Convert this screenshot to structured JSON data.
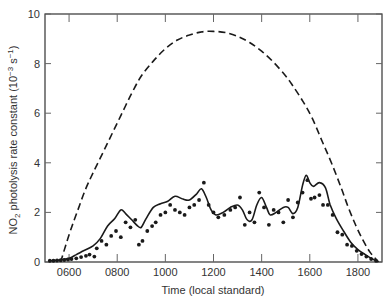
{
  "chart_data": {
    "type": "line",
    "title": "",
    "xlabel": "Time (local standard)",
    "ylabel": "NO2 photolysis rate constant (10^-3 s^-1)",
    "ylabel_parts": {
      "pre": "NO",
      "sub": "2",
      "mid": " photolysis rate constant (10",
      "sup1": "−3",
      "mid2": " s",
      "sup2": "−1",
      "post": ")"
    },
    "xlim": [
      500,
      1900
    ],
    "ylim": [
      0,
      10
    ],
    "x_ticks": [
      600,
      800,
      1000,
      1200,
      1400,
      1600,
      1800
    ],
    "x_tick_labels": [
      "0600",
      "0800",
      "1000",
      "1200",
      "1400",
      "1600",
      "1800"
    ],
    "y_ticks": [
      0,
      2,
      4,
      6,
      8,
      10
    ],
    "y_tick_labels": [
      "0",
      "2",
      "4",
      "6",
      "8",
      "10"
    ],
    "grid": false,
    "legend": null,
    "series": [
      {
        "name": "Clear-sky calculated (dashed)",
        "style": "dashed",
        "color": "#1a1a1a",
        "points": [
          [
            5.65,
            0.0
          ],
          [
            6.0,
            1.1
          ],
          [
            6.33,
            2.0
          ],
          [
            6.67,
            2.9
          ],
          [
            7.0,
            3.6
          ],
          [
            7.4,
            4.4
          ],
          [
            7.8,
            5.2
          ],
          [
            8.2,
            6.0
          ],
          [
            8.6,
            6.8
          ],
          [
            9.0,
            7.5
          ],
          [
            9.5,
            8.1
          ],
          [
            10.0,
            8.6
          ],
          [
            10.5,
            8.95
          ],
          [
            11.0,
            9.15
          ],
          [
            11.5,
            9.28
          ],
          [
            12.0,
            9.3
          ],
          [
            12.5,
            9.25
          ],
          [
            13.0,
            9.1
          ],
          [
            13.5,
            8.85
          ],
          [
            14.0,
            8.5
          ],
          [
            14.5,
            8.05
          ],
          [
            15.0,
            7.5
          ],
          [
            15.3,
            7.1
          ],
          [
            15.7,
            6.5
          ],
          [
            16.1,
            5.8
          ],
          [
            16.5,
            4.9
          ],
          [
            16.9,
            4.0
          ],
          [
            17.3,
            3.0
          ],
          [
            17.6,
            2.2
          ],
          [
            17.9,
            1.5
          ],
          [
            18.2,
            0.9
          ],
          [
            18.5,
            0.4
          ],
          [
            18.85,
            0.0
          ]
        ]
      },
      {
        "name": "Measured smoothed (solid)",
        "style": "solid",
        "color": "#1a1a1a",
        "points": [
          [
            5.2,
            0.05
          ],
          [
            5.6,
            0.08
          ],
          [
            6.0,
            0.15
          ],
          [
            6.3,
            0.3
          ],
          [
            6.6,
            0.45
          ],
          [
            7.0,
            0.65
          ],
          [
            7.3,
            0.95
          ],
          [
            7.6,
            1.45
          ],
          [
            7.9,
            1.75
          ],
          [
            8.15,
            2.1
          ],
          [
            8.35,
            1.95
          ],
          [
            8.6,
            1.7
          ],
          [
            8.85,
            1.45
          ],
          [
            9.0,
            1.4
          ],
          [
            9.2,
            1.75
          ],
          [
            9.5,
            2.2
          ],
          [
            9.8,
            2.35
          ],
          [
            10.1,
            2.45
          ],
          [
            10.4,
            2.65
          ],
          [
            10.7,
            2.55
          ],
          [
            11.0,
            2.5
          ],
          [
            11.3,
            2.75
          ],
          [
            11.5,
            2.95
          ],
          [
            11.7,
            2.6
          ],
          [
            11.9,
            2.1
          ],
          [
            12.1,
            1.9
          ],
          [
            12.4,
            2.0
          ],
          [
            12.7,
            2.2
          ],
          [
            13.0,
            2.3
          ],
          [
            13.2,
            2.1
          ],
          [
            13.4,
            1.7
          ],
          [
            13.6,
            1.7
          ],
          [
            13.8,
            2.3
          ],
          [
            14.0,
            2.6
          ],
          [
            14.2,
            2.2
          ],
          [
            14.35,
            1.9
          ],
          [
            14.6,
            2.0
          ],
          [
            14.9,
            2.2
          ],
          [
            15.1,
            2.2
          ],
          [
            15.3,
            1.95
          ],
          [
            15.5,
            2.2
          ],
          [
            15.7,
            3.1
          ],
          [
            15.85,
            3.5
          ],
          [
            16.0,
            3.2
          ],
          [
            16.15,
            3.05
          ],
          [
            16.4,
            3.2
          ],
          [
            16.65,
            3.0
          ],
          [
            16.85,
            2.3
          ],
          [
            17.1,
            1.75
          ],
          [
            17.4,
            1.25
          ],
          [
            17.7,
            0.8
          ],
          [
            18.0,
            0.5
          ],
          [
            18.3,
            0.3
          ],
          [
            18.6,
            0.12
          ],
          [
            18.85,
            0.02
          ]
        ]
      },
      {
        "name": "Measured values (dots)",
        "style": "markers",
        "color": "#1a1a1a",
        "points": [
          [
            5.2,
            0.05
          ],
          [
            5.35,
            0.05
          ],
          [
            5.5,
            0.06
          ],
          [
            5.65,
            0.07
          ],
          [
            5.8,
            0.08
          ],
          [
            5.95,
            0.1
          ],
          [
            6.1,
            0.12
          ],
          [
            6.3,
            0.15
          ],
          [
            6.5,
            0.2
          ],
          [
            6.7,
            0.25
          ],
          [
            6.85,
            0.3
          ],
          [
            7.05,
            0.22
          ],
          [
            7.15,
            0.55
          ],
          [
            7.35,
            0.85
          ],
          [
            7.55,
            0.7
          ],
          [
            7.75,
            1.05
          ],
          [
            7.95,
            1.25
          ],
          [
            8.15,
            1.0
          ],
          [
            8.35,
            1.6
          ],
          [
            8.55,
            1.4
          ],
          [
            8.75,
            1.7
          ],
          [
            8.9,
            0.7
          ],
          [
            9.05,
            0.85
          ],
          [
            9.25,
            1.25
          ],
          [
            9.45,
            1.45
          ],
          [
            9.6,
            1.6
          ],
          [
            9.8,
            1.9
          ],
          [
            10.0,
            2.0
          ],
          [
            10.2,
            2.3
          ],
          [
            10.4,
            2.1
          ],
          [
            10.6,
            2.0
          ],
          [
            10.8,
            1.9
          ],
          [
            11.0,
            2.2
          ],
          [
            11.2,
            2.3
          ],
          [
            11.4,
            2.5
          ],
          [
            11.6,
            3.2
          ],
          [
            11.8,
            2.3
          ],
          [
            12.0,
            2.0
          ],
          [
            12.2,
            1.8
          ],
          [
            12.45,
            1.9
          ],
          [
            12.7,
            2.1
          ],
          [
            12.9,
            2.2
          ],
          [
            13.1,
            2.6
          ],
          [
            13.3,
            1.5
          ],
          [
            13.5,
            2.0
          ],
          [
            13.7,
            1.6
          ],
          [
            13.9,
            2.8
          ],
          [
            14.1,
            2.2
          ],
          [
            14.3,
            1.5
          ],
          [
            14.5,
            2.1
          ],
          [
            14.7,
            2.0
          ],
          [
            14.9,
            1.6
          ],
          [
            15.1,
            2.5
          ],
          [
            15.3,
            1.8
          ],
          [
            15.5,
            2.4
          ],
          [
            15.7,
            2.8
          ],
          [
            15.9,
            3.3
          ],
          [
            16.05,
            2.55
          ],
          [
            16.2,
            2.6
          ],
          [
            16.4,
            2.7
          ],
          [
            16.55,
            2.3
          ],
          [
            16.75,
            2.3
          ],
          [
            16.95,
            1.9
          ],
          [
            17.15,
            1.2
          ],
          [
            17.35,
            1.1
          ],
          [
            17.55,
            0.7
          ],
          [
            17.75,
            0.65
          ],
          [
            17.95,
            0.45
          ],
          [
            18.15,
            0.32
          ],
          [
            18.35,
            0.22
          ],
          [
            18.55,
            0.12
          ],
          [
            18.75,
            0.05
          ]
        ]
      }
    ]
  }
}
